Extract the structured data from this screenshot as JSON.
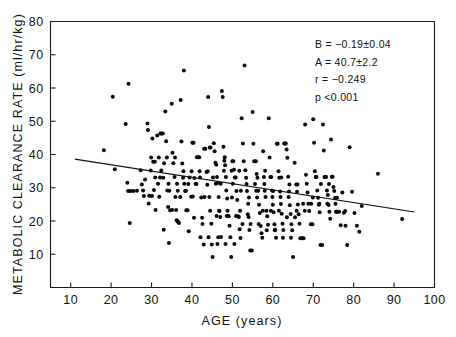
{
  "chart_data": {
    "type": "scatter",
    "title": "",
    "xlabel": "AGE (years)",
    "ylabel": "METABOLIC CLEARANCE RATE (ml/hr/kg)",
    "xlim": [
      5,
      100
    ],
    "ylim": [
      0,
      80
    ],
    "xticks": [
      10,
      20,
      30,
      40,
      50,
      60,
      70,
      80,
      90,
      100
    ],
    "yticks": [
      10,
      20,
      30,
      40,
      50,
      60,
      70,
      80
    ],
    "xtick_labels": [
      "10",
      "20",
      "30",
      "40",
      "50",
      "60",
      "70",
      "80",
      "90",
      "100"
    ],
    "ytick_labels": [
      "10",
      "20",
      "30",
      "40",
      "50",
      "60",
      "70",
      "80"
    ],
    "grid": false,
    "legend": null,
    "marker": "filled-circle",
    "marker_color": "#0a0a0a",
    "marker_size": 4,
    "regression_line": {
      "slope": -0.19,
      "intercept": 40.7,
      "x_start": 11,
      "x_end": 95,
      "y_start": 38.6,
      "y_end": 22.7,
      "color": "#111111"
    },
    "annotations": [
      {
        "name": "slope",
        "text": "B = −0.19±0.04"
      },
      {
        "name": "intercept",
        "text": "A = 40.7±2.2"
      },
      {
        "name": "correlation",
        "text": "r = −0.249"
      },
      {
        "name": "pvalue",
        "text": "p  <0.001"
      }
    ],
    "n_points": 330,
    "points": [
      [
        18.2,
        41.3
      ],
      [
        20.4,
        57.4
      ],
      [
        20.9,
        35.6
      ],
      [
        23.6,
        49.2
      ],
      [
        24.3,
        61.3
      ],
      [
        24.0,
        31.5
      ],
      [
        24.2,
        29.0
      ],
      [
        24.8,
        29.0
      ],
      [
        25.5,
        29.0
      ],
      [
        24.6,
        19.4
      ],
      [
        26.4,
        29.1
      ],
      [
        27.3,
        35.3
      ],
      [
        27.6,
        31.0
      ],
      [
        27.9,
        29.2
      ],
      [
        28.4,
        32.5
      ],
      [
        29.0,
        49.3
      ],
      [
        29.1,
        47.4
      ],
      [
        29.4,
        27.6
      ],
      [
        29.3,
        25.3
      ],
      [
        29.8,
        35.2
      ],
      [
        30.2,
        44.8
      ],
      [
        30.4,
        37.8
      ],
      [
        30.8,
        37.8
      ],
      [
        30.6,
        29.3
      ],
      [
        31.0,
        23.3
      ],
      [
        31.4,
        45.7
      ],
      [
        31.6,
        31.2
      ],
      [
        31.9,
        27.3
      ],
      [
        32.2,
        46.3
      ],
      [
        32.5,
        46.3
      ],
      [
        32.8,
        46.3
      ],
      [
        32.4,
        35.2
      ],
      [
        32.9,
        33.0
      ],
      [
        33.0,
        17.4
      ],
      [
        33.4,
        52.9
      ],
      [
        33.6,
        44.0
      ],
      [
        33.9,
        29.2
      ],
      [
        34.1,
        24.2
      ],
      [
        34.3,
        13.4
      ],
      [
        34.6,
        23.2
      ],
      [
        35.0,
        55.3
      ],
      [
        35.2,
        40.5
      ],
      [
        35.4,
        37.4
      ],
      [
        35.7,
        33.2
      ],
      [
        35.9,
        27.2
      ],
      [
        36.2,
        20.2
      ],
      [
        36.4,
        20.0
      ],
      [
        36.6,
        19.6
      ],
      [
        36.8,
        19.4
      ],
      [
        37.2,
        56.4
      ],
      [
        37.4,
        43.9
      ],
      [
        37.6,
        37.3
      ],
      [
        37.8,
        33.0
      ],
      [
        38.0,
        65.3
      ],
      [
        38.3,
        29.0
      ],
      [
        38.6,
        23.2
      ],
      [
        38.9,
        23.2
      ],
      [
        39.2,
        16.9
      ],
      [
        39.4,
        33.1
      ],
      [
        39.8,
        27.3
      ],
      [
        40.1,
        43.5
      ],
      [
        40.4,
        43.5
      ],
      [
        40.6,
        32.9
      ],
      [
        40.9,
        31.2
      ],
      [
        41.2,
        39.2
      ],
      [
        41.5,
        39.2
      ],
      [
        41.8,
        39.2
      ],
      [
        42.0,
        33.1
      ],
      [
        42.3,
        27.1
      ],
      [
        42.6,
        19.1
      ],
      [
        42.9,
        12.9
      ],
      [
        43.0,
        41.7
      ],
      [
        43.3,
        41.7
      ],
      [
        43.6,
        34.7
      ],
      [
        43.8,
        30.9
      ],
      [
        44.0,
        57.3
      ],
      [
        44.2,
        48.3
      ],
      [
        44.4,
        42.1
      ],
      [
        44.6,
        42.1
      ],
      [
        44.3,
        27.2
      ],
      [
        44.8,
        19.2
      ],
      [
        44.9,
        12.9
      ],
      [
        45.1,
        9.2
      ],
      [
        45.4,
        43.4
      ],
      [
        45.6,
        41.0
      ],
      [
        45.8,
        37.5
      ],
      [
        46.0,
        36.9
      ],
      [
        46.2,
        33.2
      ],
      [
        46.4,
        31.5
      ],
      [
        46.6,
        27.2
      ],
      [
        46.8,
        23.0
      ],
      [
        47.0,
        21.2
      ],
      [
        47.2,
        15.2
      ],
      [
        47.4,
        59.1
      ],
      [
        47.6,
        57.3
      ],
      [
        47.8,
        42.3
      ],
      [
        48.0,
        38.1
      ],
      [
        48.2,
        36.8
      ],
      [
        48.4,
        33.2
      ],
      [
        48.5,
        29.2
      ],
      [
        48.7,
        26.8
      ],
      [
        48.9,
        21.6
      ],
      [
        49.1,
        21.4
      ],
      [
        49.3,
        18.6
      ],
      [
        49.5,
        15.1
      ],
      [
        49.7,
        9.2
      ],
      [
        50.0,
        38.0
      ],
      [
        50.2,
        38.0
      ],
      [
        50.4,
        35.4
      ],
      [
        50.6,
        33.1
      ],
      [
        50.8,
        33.1
      ],
      [
        51.0,
        29.0
      ],
      [
        51.2,
        26.3
      ],
      [
        51.4,
        21.4
      ],
      [
        51.6,
        21.2
      ],
      [
        51.8,
        17.5
      ],
      [
        52.0,
        14.9
      ],
      [
        52.3,
        50.9
      ],
      [
        52.6,
        43.3
      ],
      [
        52.8,
        38.0
      ],
      [
        53.0,
        66.8
      ],
      [
        53.2,
        35.3
      ],
      [
        53.4,
        33.0
      ],
      [
        53.6,
        29.0
      ],
      [
        53.8,
        22.0
      ],
      [
        54.0,
        21.2
      ],
      [
        54.2,
        17.3
      ],
      [
        54.4,
        11.1
      ],
      [
        54.8,
        11.1
      ],
      [
        55.0,
        52.8
      ],
      [
        55.2,
        43.2
      ],
      [
        55.4,
        38.0
      ],
      [
        55.8,
        38.0
      ],
      [
        56.0,
        34.1
      ],
      [
        56.2,
        33.0
      ],
      [
        56.4,
        29.1
      ],
      [
        56.6,
        24.9
      ],
      [
        56.8,
        22.4
      ],
      [
        57.0,
        18.5
      ],
      [
        57.2,
        16.3
      ],
      [
        57.4,
        15.0
      ],
      [
        57.6,
        41.0
      ],
      [
        57.8,
        33.2
      ],
      [
        58.0,
        29.1
      ],
      [
        58.2,
        27.2
      ],
      [
        58.4,
        23.1
      ],
      [
        58.6,
        21.4
      ],
      [
        58.8,
        18.9
      ],
      [
        59.0,
        50.9
      ],
      [
        59.2,
        39.1
      ],
      [
        59.4,
        33.2
      ],
      [
        59.6,
        33.2
      ],
      [
        59.8,
        29.2
      ],
      [
        60.0,
        24.9
      ],
      [
        60.2,
        22.6
      ],
      [
        60.4,
        19.0
      ],
      [
        60.6,
        17.4
      ],
      [
        60.8,
        15.0
      ],
      [
        61.0,
        43.2
      ],
      [
        61.2,
        43.2
      ],
      [
        61.4,
        35.0
      ],
      [
        61.6,
        33.0
      ],
      [
        61.8,
        28.9
      ],
      [
        62.0,
        25.1
      ],
      [
        62.2,
        22.2
      ],
      [
        62.4,
        19.2
      ],
      [
        62.6,
        17.3
      ],
      [
        62.8,
        43.3
      ],
      [
        63.0,
        43.3
      ],
      [
        63.2,
        43.3
      ],
      [
        63.4,
        41.5
      ],
      [
        63.6,
        39.0
      ],
      [
        63.8,
        33.3
      ],
      [
        64.0,
        28.9
      ],
      [
        64.2,
        24.7
      ],
      [
        64.4,
        22.1
      ],
      [
        64.6,
        19.0
      ],
      [
        64.8,
        17.2
      ],
      [
        65.0,
        9.2
      ],
      [
        65.4,
        37.5
      ],
      [
        65.8,
        31.0
      ],
      [
        66.0,
        28.8
      ],
      [
        66.2,
        25.0
      ],
      [
        66.4,
        22.0
      ],
      [
        66.6,
        19.2
      ],
      [
        66.8,
        14.8
      ],
      [
        67.2,
        14.8
      ],
      [
        67.6,
        14.8
      ],
      [
        68.0,
        49.0
      ],
      [
        68.2,
        33.9
      ],
      [
        68.4,
        31.2
      ],
      [
        68.6,
        28.6
      ],
      [
        68.8,
        25.2
      ],
      [
        69.0,
        23.0
      ],
      [
        69.4,
        19.0
      ],
      [
        69.8,
        19.0
      ],
      [
        70.0,
        50.6
      ],
      [
        70.2,
        43.5
      ],
      [
        70.4,
        35.0
      ],
      [
        70.6,
        33.2
      ],
      [
        70.8,
        33.2
      ],
      [
        71.0,
        29.2
      ],
      [
        71.2,
        27.0
      ],
      [
        71.4,
        24.9
      ],
      [
        71.6,
        22.6
      ],
      [
        71.8,
        12.8
      ],
      [
        72.2,
        12.8
      ],
      [
        72.4,
        49.0
      ],
      [
        72.6,
        41.2
      ],
      [
        72.8,
        33.2
      ],
      [
        73.0,
        33.2
      ],
      [
        73.2,
        33.2
      ],
      [
        73.4,
        29.2
      ],
      [
        73.6,
        27.8
      ],
      [
        73.8,
        24.8
      ],
      [
        74.0,
        22.8
      ],
      [
        74.2,
        20.7
      ],
      [
        74.4,
        44.5
      ],
      [
        74.6,
        33.3
      ],
      [
        74.8,
        33.3
      ],
      [
        75.0,
        30.2
      ],
      [
        75.2,
        29.0
      ],
      [
        75.4,
        26.9
      ],
      [
        75.6,
        22.8
      ],
      [
        75.8,
        22.8
      ],
      [
        76.0,
        22.8
      ],
      [
        76.4,
        22.8
      ],
      [
        76.8,
        18.7
      ],
      [
        77.2,
        28.6
      ],
      [
        77.6,
        22.5
      ],
      [
        78.0,
        18.6
      ],
      [
        78.4,
        12.8
      ],
      [
        79.0,
        42.2
      ],
      [
        79.6,
        28.8
      ],
      [
        80.2,
        22.4
      ],
      [
        80.8,
        18.6
      ],
      [
        81.4,
        16.8
      ],
      [
        82.0,
        24.5
      ],
      [
        86.0,
        34.2
      ],
      [
        92.0,
        20.6
      ],
      [
        30.1,
        27.5
      ],
      [
        33.1,
        37.4
      ],
      [
        35.1,
        23.3
      ],
      [
        36.1,
        23.3
      ],
      [
        37.1,
        27.2
      ],
      [
        39.1,
        31.1
      ],
      [
        41.1,
        31.1
      ],
      [
        43.1,
        27.2
      ],
      [
        45.2,
        33.1
      ],
      [
        47.1,
        31.2
      ],
      [
        48.1,
        39.2
      ],
      [
        50.1,
        31.2
      ],
      [
        52.1,
        29.1
      ],
      [
        54.1,
        27.1
      ],
      [
        56.1,
        27.1
      ],
      [
        58.1,
        35.1
      ],
      [
        60.1,
        29.0
      ],
      [
        62.1,
        33.1
      ],
      [
        64.1,
        31.0
      ],
      [
        66.1,
        31.0
      ],
      [
        46.1,
        21.5
      ],
      [
        48.6,
        21.5
      ],
      [
        50.9,
        21.5
      ],
      [
        44.1,
        15.1
      ],
      [
        46.5,
        15.1
      ],
      [
        42.1,
        15.1
      ],
      [
        40.2,
        27.4
      ],
      [
        38.1,
        31.2
      ],
      [
        36.3,
        31.2
      ],
      [
        34.2,
        31.2
      ],
      [
        49.9,
        27.1
      ],
      [
        51.9,
        23.1
      ],
      [
        53.9,
        25.2
      ],
      [
        55.9,
        29.1
      ],
      [
        57.9,
        31.1
      ],
      [
        45.9,
        31.2
      ],
      [
        43.9,
        35.0
      ],
      [
        41.9,
        35.0
      ],
      [
        39.9,
        35.0
      ],
      [
        37.9,
        35.0
      ],
      [
        35.8,
        39.1
      ],
      [
        33.8,
        39.1
      ],
      [
        31.8,
        39.1
      ],
      [
        29.9,
        39.1
      ],
      [
        28.1,
        27.5
      ],
      [
        30.9,
        33.1
      ],
      [
        32.1,
        33.1
      ],
      [
        34.4,
        29.1
      ],
      [
        36.5,
        29.1
      ],
      [
        38.5,
        29.1
      ],
      [
        47.9,
        35.1
      ],
      [
        49.8,
        35.1
      ],
      [
        51.7,
        35.1
      ],
      [
        53.5,
        31.1
      ],
      [
        55.6,
        31.1
      ],
      [
        59.9,
        27.2
      ],
      [
        61.9,
        27.2
      ],
      [
        63.9,
        27.2
      ],
      [
        65.9,
        23.1
      ],
      [
        67.9,
        23.1
      ],
      [
        69.9,
        27.1
      ],
      [
        71.9,
        31.1
      ],
      [
        73.9,
        31.1
      ],
      [
        75.9,
        27.0
      ],
      [
        77.9,
        23.0
      ],
      [
        44.5,
        23.1
      ],
      [
        46.7,
        23.1
      ],
      [
        48.8,
        23.1
      ],
      [
        42.5,
        21.0
      ],
      [
        40.5,
        21.0
      ],
      [
        52.5,
        19.1
      ],
      [
        54.5,
        19.1
      ],
      [
        56.5,
        19.1
      ],
      [
        58.5,
        17.2
      ],
      [
        60.5,
        17.2
      ],
      [
        62.5,
        15.0
      ],
      [
        64.5,
        15.0
      ],
      [
        50.5,
        13.1
      ],
      [
        48.3,
        13.1
      ],
      [
        46.3,
        13.1
      ],
      [
        57.5,
        23.1
      ],
      [
        59.5,
        23.1
      ],
      [
        61.5,
        23.1
      ],
      [
        63.5,
        21.1
      ],
      [
        65.5,
        21.1
      ],
      [
        67.5,
        25.2
      ],
      [
        69.5,
        25.2
      ],
      [
        71.5,
        25.2
      ],
      [
        73.5,
        25.2
      ],
      [
        75.5,
        25.2
      ]
    ]
  },
  "figure": {
    "background_color": "#ffffff",
    "axis_color": "#1a1a1a"
  }
}
